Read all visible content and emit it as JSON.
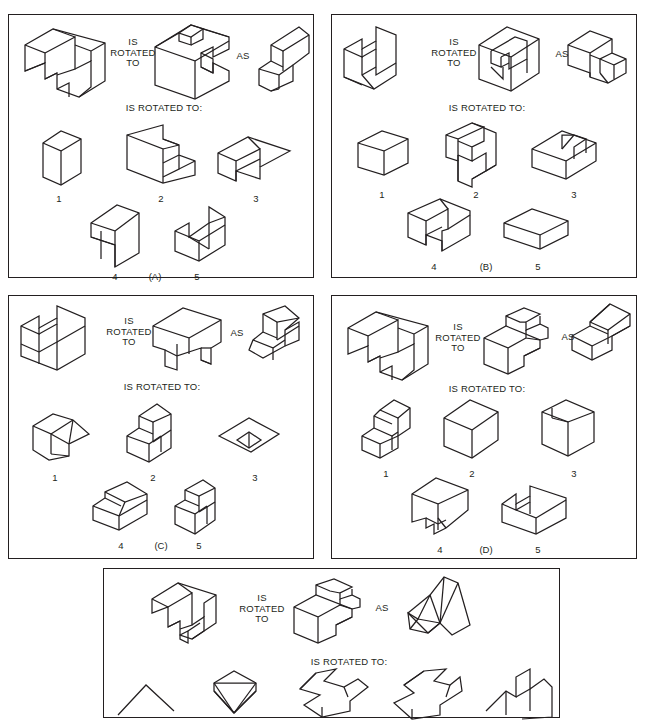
{
  "document": {
    "type": "spatial-rotation-test-worksheet",
    "background": "#ffffff",
    "ink_color": "#231f20",
    "panel_count": 5
  },
  "labels": {
    "is_rotated_to_stacked": "IS\nROTATED\nTO",
    "as": "AS",
    "is_rotated_to_inline": "IS ROTATED TO:",
    "choice_numbers": [
      "1",
      "2",
      "3",
      "4",
      "5"
    ]
  },
  "panels": [
    {
      "id": "A",
      "caption": "(A)",
      "prompt_label": "IS\nROTATED\nTO",
      "as_label": "AS",
      "row_label": "IS ROTATED TO:",
      "stimulus_shapes": [
        "open-cube-frame",
        "notched-block",
        "wedge-on-block"
      ],
      "choices": [
        {
          "number": "1",
          "shape": "tall-rectangular-prism"
        },
        {
          "number": "2",
          "shape": "notched-channel-block"
        },
        {
          "number": "3",
          "shape": "flat-L-plate"
        },
        {
          "number": "4",
          "shape": "stepped-T-block"
        },
        {
          "number": "5",
          "shape": "wedge-in-trough"
        }
      ]
    },
    {
      "id": "B",
      "caption": "(B)",
      "prompt_label": "IS\nROTATED\nTO",
      "as_label": "AS",
      "row_label": "IS ROTATED TO:",
      "stimulus_shapes": [
        "stepped-frame-block",
        "slotted-cube",
        "block-with-small-cube"
      ],
      "choices": [
        {
          "number": "1",
          "shape": "plain-box"
        },
        {
          "number": "2",
          "shape": "double-notch-block"
        },
        {
          "number": "3",
          "shape": "slot-top-box"
        },
        {
          "number": "4",
          "shape": "U-channel-box"
        },
        {
          "number": "5",
          "shape": "flat-slab"
        }
      ]
    },
    {
      "id": "C",
      "caption": "(C)",
      "prompt_label": "IS\nROTATED\nTO",
      "as_label": "AS",
      "row_label": "IS ROTATED TO:",
      "stimulus_shapes": [
        "double-step-frame",
        "table-leg-block",
        "ramp-on-block"
      ],
      "choices": [
        {
          "number": "1",
          "shape": "low-ramp-block"
        },
        {
          "number": "2",
          "shape": "upright-ramp-block"
        },
        {
          "number": "3",
          "shape": "flat-diamond-plate"
        },
        {
          "number": "4",
          "shape": "wide-ramp-block"
        },
        {
          "number": "5",
          "shape": "narrow-ramp-block"
        }
      ]
    },
    {
      "id": "D",
      "caption": "(D)",
      "prompt_label": "IS\nROTATED\nTO",
      "as_label": "AS",
      "row_label": "IS ROTATED TO:",
      "stimulus_shapes": [
        "open-cube-frame",
        "L-shaped-slot-block",
        "double-ramp-stack"
      ],
      "choices": [
        {
          "number": "1",
          "shape": "two-step-block"
        },
        {
          "number": "2",
          "shape": "plain-cube"
        },
        {
          "number": "3",
          "shape": "split-face-cube"
        },
        {
          "number": "4",
          "shape": "tapered-notch-block"
        },
        {
          "number": "5",
          "shape": "corner-notch-slab"
        }
      ]
    },
    {
      "id": "E",
      "caption": "",
      "prompt_label": "IS\nROTATED\nTO",
      "as_label": "AS",
      "row_label": "IS ROTATED TO:",
      "stimulus_shapes": [
        "slotted-open-cube",
        "L-block-with-hook-slot",
        "faceted-wedge-pair"
      ],
      "choices": [
        {
          "number": "",
          "shape": "partial-plate-cropped"
        },
        {
          "number": "",
          "shape": "partial-faceted-cone-cropped"
        },
        {
          "number": "",
          "shape": "partial-zigzag-block-cropped"
        },
        {
          "number": "",
          "shape": "partial-arrow-block-cropped"
        },
        {
          "number": "",
          "shape": "partial-step-block-cropped"
        }
      ],
      "note": "bottom choice row is cut off by the image edge"
    }
  ]
}
